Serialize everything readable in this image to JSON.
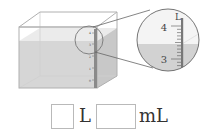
{
  "figure": {
    "tank_scale_labels": [
      "4",
      "3",
      "2",
      "1",
      "0"
    ],
    "magnifier": {
      "unit_label": "L",
      "upper_mark": "4",
      "lower_mark": "3",
      "minor_ticks_between": 9
    },
    "colors": {
      "water": "#d2d2d2",
      "tank_edge": "#b0b0b0",
      "scale_bar": "#8a8a8a"
    }
  },
  "answer": {
    "liters_value": "",
    "liters_unit": "L",
    "milliliters_value": "",
    "milliliters_unit": "mL"
  }
}
